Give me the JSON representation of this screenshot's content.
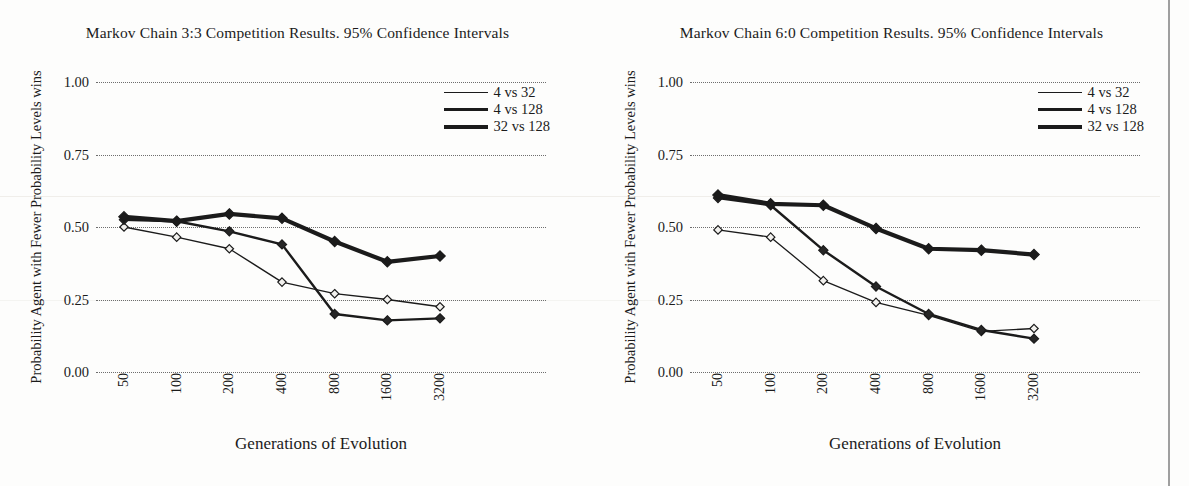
{
  "figure": {
    "background_color": "#fdfdfc",
    "ink_color": "#1b1b1b",
    "grid_color": "#6e6e6e"
  },
  "panels": [
    {
      "id": "markov-3-3",
      "title": "Markov Chain 3:3 Competition Results. 95% Confidence Intervals",
      "xlabel": "Generations of Evolution",
      "ylabel": "Probability Agent with Fewer Probability Levels wins",
      "legend": [
        {
          "label": "4 vs 32",
          "weight": "thin"
        },
        {
          "label": "4 vs 128",
          "weight": "med"
        },
        {
          "label": "32 vs 128",
          "weight": "thick"
        }
      ]
    },
    {
      "id": "markov-6-0",
      "title": "Markov Chain 6:0 Competition Results. 95% Confidence Intervals",
      "xlabel": "Generations of Evolution",
      "ylabel": "Probability Agent with Fewer Probability Levels wins",
      "legend": [
        {
          "label": "4 vs 32",
          "weight": "thin"
        },
        {
          "label": "4 vs 128",
          "weight": "med"
        },
        {
          "label": "32 vs 128",
          "weight": "thick"
        }
      ]
    }
  ],
  "chart_data": [
    {
      "type": "line",
      "title": "Markov Chain 3:3 Competition Results. 95% Confidence Intervals",
      "xlabel": "Generations of Evolution",
      "ylabel": "Probability Agent with Fewer Probability Levels wins",
      "categories": [
        "50",
        "100",
        "200",
        "400",
        "800",
        "1600",
        "3200"
      ],
      "yticks": [
        0.0,
        0.25,
        0.5,
        0.75,
        1.0
      ],
      "ytick_labels": [
        "0.00",
        "0.25",
        "0.50",
        "0.75",
        "1.00"
      ],
      "ylim": [
        0.0,
        1.0
      ],
      "grid": "horizontal-dotted",
      "legend_position": "top-right",
      "series": [
        {
          "name": "4 vs 32",
          "values": [
            0.5,
            0.465,
            0.425,
            0.31,
            0.27,
            0.25,
            0.225
          ]
        },
        {
          "name": "4 vs 128",
          "values": [
            0.525,
            0.52,
            0.485,
            0.44,
            0.2,
            0.178,
            0.185
          ]
        },
        {
          "name": "32 vs 128",
          "values": [
            0.535,
            0.52,
            0.545,
            0.53,
            0.45,
            0.38,
            0.365
          ]
        }
      ],
      "series_extra": [
        {
          "name": "32 vs 128",
          "last_value": 0.4
        }
      ]
    },
    {
      "type": "line",
      "title": "Markov Chain 6:0 Competition Results. 95% Confidence Intervals",
      "xlabel": "Generations of Evolution",
      "ylabel": "Probability Agent with Fewer Probability Levels wins",
      "categories": [
        "50",
        "100",
        "200",
        "400",
        "800",
        "1600",
        "3200"
      ],
      "yticks": [
        0.0,
        0.25,
        0.5,
        0.75,
        1.0
      ],
      "ytick_labels": [
        "0.00",
        "0.25",
        "0.50",
        "0.75",
        "1.00"
      ],
      "ylim": [
        0.0,
        1.0
      ],
      "grid": "horizontal-dotted",
      "legend_position": "top-right",
      "series": [
        {
          "name": "4 vs 32",
          "values": [
            0.49,
            0.465,
            0.315,
            0.24,
            0.195,
            0.14,
            0.15
          ]
        },
        {
          "name": "4 vs 128",
          "values": [
            0.6,
            0.575,
            0.42,
            0.295,
            0.2,
            0.145,
            0.115
          ]
        },
        {
          "name": "32 vs 128",
          "values": [
            0.61,
            0.58,
            0.575,
            0.495,
            0.425,
            0.42,
            0.405
          ]
        }
      ]
    }
  ]
}
